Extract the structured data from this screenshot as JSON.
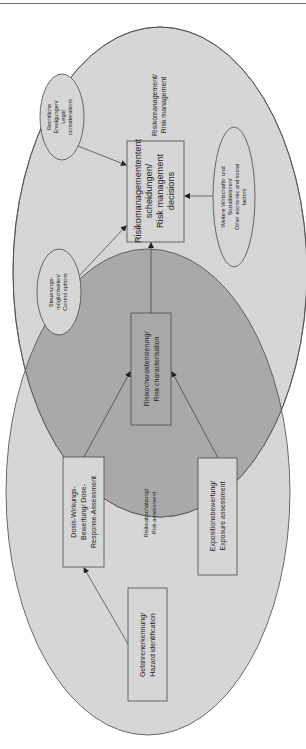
{
  "figure": {
    "type": "venn-style process diagram (rotated 90°)",
    "colors": {
      "outer_fill": "#d6d6d6",
      "overlap_fill": "#a9a9a9",
      "stroke": "#4a4a4a",
      "box_fill": "#d6d6d6",
      "text": "#222222"
    }
  },
  "regions": {
    "risk_management": {
      "label_line1": "Risikomanagement/",
      "label_line2": "Risk management"
    },
    "risk_assessment": {
      "label_line1": "Risikoabschätzung/",
      "label_line2": "Risk assessment"
    }
  },
  "boxes": {
    "rm_decisions": {
      "line1": "Risikomanagemententent",
      "line2": "scheidungen/",
      "line3": "Risk management",
      "line4": "decisions"
    },
    "risk_characterisation": {
      "line1": "Risikocharakterisierung/",
      "line2": "Risk characterisation"
    },
    "dose_response": {
      "line1": "Dosis-Wirkungs-",
      "line2": "Bewertung/ Dose-",
      "line3": "Response-Assessment"
    },
    "exposure": {
      "line1": "Expositionsbewertung/",
      "line2": "Exposure assessment"
    },
    "hazard_id": {
      "line1": "Gefahrenerkennung/",
      "line2": "Hazard identification"
    }
  },
  "inputs": {
    "legal": {
      "line1": "Rechtliche",
      "line2": "Erwägungen/",
      "line3": "Legal",
      "line4": "considerations"
    },
    "control": {
      "line1": "Steuerungs-",
      "line2": "möglichkeiten/",
      "line3": "Control options"
    },
    "other_factors": {
      "line1": "Weitere Wirtschafts- und",
      "line2": "Sozialfaktoren/",
      "line3": "Other economic and social",
      "line4": "factors"
    }
  },
  "arrows": [
    {
      "from": "hazard_id",
      "to": "dose_response"
    },
    {
      "from": "dose_response",
      "to": "risk_characterisation"
    },
    {
      "from": "exposure",
      "to": "risk_characterisation"
    },
    {
      "from": "risk_characterisation",
      "to": "rm_decisions"
    },
    {
      "from": "legal",
      "to": "rm_decisions"
    },
    {
      "from": "control",
      "to": "rm_decisions"
    },
    {
      "from": "other_factors",
      "to": "rm_decisions"
    }
  ]
}
